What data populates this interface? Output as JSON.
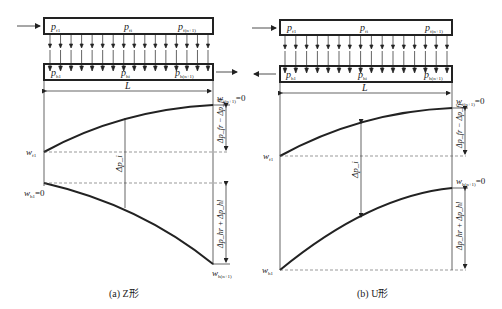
{
  "figure": {
    "panels": [
      {
        "id": "a",
        "caption": "(a) Z形",
        "top_channel": {
          "labels": [
            {
              "base": "p",
              "sub": "f1"
            },
            {
              "base": "p",
              "sub": "fi"
            },
            {
              "base": "p",
              "sub": "f(n+1)"
            }
          ]
        },
        "bottom_channel": {
          "labels": [
            {
              "base": "p",
              "sub": "h1"
            },
            {
              "base": "p",
              "sub": "hi"
            },
            {
              "base": "p",
              "sub": "h(n+1)"
            }
          ]
        },
        "flow_in_direction": "right",
        "flow_out_direction": "right",
        "length_label": "L",
        "curve_labels": {
          "w_f1": {
            "base": "w",
            "sub": "f1",
            "suffix": ""
          },
          "w_f_end": {
            "base": "w",
            "sub": "f(n+1)",
            "suffix": "=0"
          },
          "w_h1": {
            "base": "w",
            "sub": "h1",
            "suffix": "=0"
          },
          "w_h_end": {
            "base": "w",
            "sub": "h(n+1)",
            "suffix": ""
          }
        },
        "dimension_labels": {
          "delta_pi": "Δp_i",
          "upper": "Δp_fr − Δp_fi",
          "lower": "Δp_hr + Δp_hl"
        }
      },
      {
        "id": "b",
        "caption": "(b) U形",
        "top_channel": {
          "labels": [
            {
              "base": "p",
              "sub": "f1"
            },
            {
              "base": "p",
              "sub": "fi"
            },
            {
              "base": "p",
              "sub": "f(n+1)"
            }
          ]
        },
        "bottom_channel": {
          "labels": [
            {
              "base": "p",
              "sub": "h1"
            },
            {
              "base": "p",
              "sub": "hi"
            },
            {
              "base": "p",
              "sub": "h(n+1)"
            }
          ]
        },
        "flow_in_direction": "right",
        "flow_out_direction": "left",
        "length_label": "L",
        "curve_labels": {
          "w_f1": {
            "base": "w",
            "sub": "f1",
            "suffix": ""
          },
          "w_f_end": {
            "base": "w",
            "sub": "f(n+1)",
            "suffix": "=0"
          },
          "w_h1": {
            "base": "w",
            "sub": "h1",
            "suffix": ""
          },
          "w_h_end": {
            "base": "w",
            "sub": "h(n+1)",
            "suffix": "=0"
          }
        },
        "dimension_labels": {
          "delta_pi": "Δp_i",
          "upper": "Δp_fr − Δp_fi",
          "lower": "Δp_hr + Δp_hl"
        }
      }
    ],
    "arrow_count": 16,
    "colors": {
      "ink": "#222222",
      "background": "#ffffff"
    }
  }
}
